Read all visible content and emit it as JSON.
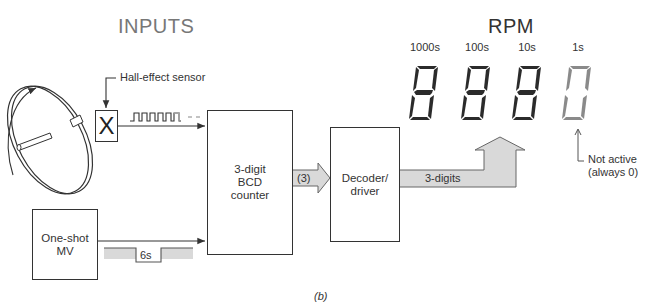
{
  "diagram": {
    "section_titles": {
      "inputs": "INPUTS",
      "output": "RPM"
    },
    "sensor": {
      "label": "Hall-effect sensor",
      "symbol": "X"
    },
    "blocks": {
      "counter": {
        "lines": [
          "3-digit",
          "BCD",
          "counter"
        ]
      },
      "decoder": {
        "lines": [
          "Decoder/",
          "driver"
        ]
      },
      "oneshot": {
        "lines": [
          "One-shot",
          "MV"
        ]
      }
    },
    "bus_labels": {
      "counter_to_decoder": "(3)",
      "decoder_to_display": "3-digits"
    },
    "pulse_label": "6s",
    "displays": [
      {
        "label": "1000s",
        "active": true
      },
      {
        "label": "100s",
        "active": true
      },
      {
        "label": "10s",
        "active": true
      },
      {
        "label": "1s",
        "active": false,
        "value": "0"
      }
    ],
    "annotation": {
      "line1": "Not active",
      "line2": "(always 0)"
    },
    "caption": "(b)",
    "colors": {
      "bus_fill": "#d9d9d9",
      "display_bg": "#cfcfcf",
      "segment": "#2b2b2b",
      "inactive_segment": "#8a8a8a"
    }
  }
}
